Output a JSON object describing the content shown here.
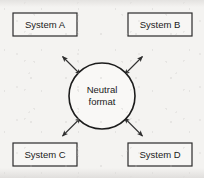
{
  "diagram": {
    "type": "hub-and-spoke",
    "background_color": "#f4f3f1",
    "line_color": "#2f2f2f",
    "hub": {
      "name": "neutral-format-hub",
      "shape": "circle",
      "label_line_1": "Neutral",
      "label_line_2": "format",
      "center_x": 102,
      "center_y": 96,
      "radius": 33,
      "fill_color": "#f9f8f6",
      "stroke_color": "#1c1c1c"
    },
    "nodes": [
      {
        "id": "system-a",
        "label": "System A",
        "shape": "rectangle",
        "position": "top-left",
        "x": 13,
        "y": 13,
        "width": 64,
        "height": 23,
        "fill_color": "#f7f6f4",
        "stroke_color": "#2b2b2b"
      },
      {
        "id": "system-b",
        "label": "System B",
        "shape": "rectangle",
        "position": "top-right",
        "x": 128,
        "y": 13,
        "width": 64,
        "height": 23,
        "fill_color": "#f7f6f4",
        "stroke_color": "#2b2b2b"
      },
      {
        "id": "system-c",
        "label": "System C",
        "shape": "rectangle",
        "position": "bottom-left",
        "x": 13,
        "y": 143,
        "width": 64,
        "height": 23,
        "fill_color": "#f7f6f4",
        "stroke_color": "#2b2b2b"
      },
      {
        "id": "system-d",
        "label": "System D",
        "shape": "rectangle",
        "position": "bottom-right",
        "x": 128,
        "y": 143,
        "width": 64,
        "height": 23,
        "fill_color": "#f7f6f4",
        "stroke_color": "#2b2b2b"
      }
    ],
    "connectors": [
      {
        "id": "connector-a",
        "from": "system-a",
        "to": "neutral-format-hub",
        "direction": "bidirectional",
        "arrowheads": "both-ends",
        "style": "solid"
      },
      {
        "id": "connector-b",
        "from": "system-b",
        "to": "neutral-format-hub",
        "direction": "bidirectional",
        "arrowheads": "both-ends",
        "style": "solid"
      },
      {
        "id": "connector-c",
        "from": "system-c",
        "to": "neutral-format-hub",
        "direction": "bidirectional",
        "arrowheads": "both-ends",
        "style": "solid"
      },
      {
        "id": "connector-d",
        "from": "system-d",
        "to": "neutral-format-hub",
        "direction": "bidirectional",
        "arrowheads": "both-ends",
        "style": "solid"
      }
    ]
  }
}
